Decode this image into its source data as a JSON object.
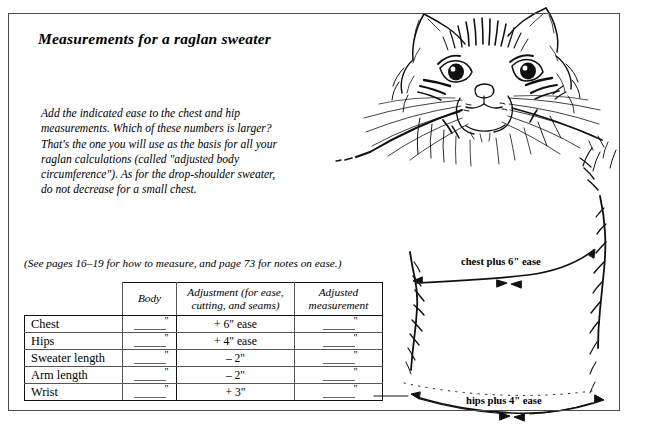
{
  "page": {
    "title": "Measurements for a raglan sweater",
    "intro": "Add the indicated ease to the chest and hip measurements. Which of these numbers is larger? That's the one you will use as the basis for all your raglan calculations (called \"adjusted body circumference\"). As for the drop-shoulder sweater, do not decrease for a small chest.",
    "caption": "(See pages 16–19 for how to measure, and page 73 for notes on ease.)"
  },
  "table": {
    "headers": [
      "",
      "Body",
      "Adjustment (for ease, cutting, and seams)",
      "Adjusted measurement"
    ],
    "rows": [
      {
        "label": "Chest",
        "body": "\"",
        "adjustment": "+ 6\" ease",
        "adjusted": "\""
      },
      {
        "label": "Hips",
        "body": "\"",
        "adjustment": "+ 4\" ease",
        "adjusted": "\""
      },
      {
        "label": "Sweater length",
        "body": "\"",
        "adjustment": "– 2\"",
        "adjusted": "\""
      },
      {
        "label": "Arm length",
        "body": "\"",
        "adjustment": "– 2\"",
        "adjusted": "\""
      },
      {
        "label": "Wrist",
        "body": "\"",
        "adjustment": "+ 3\"",
        "adjusted": "\""
      }
    ]
  },
  "annotations": {
    "chest": "chest plus 6\" ease",
    "hips": "hips plus 4\" ease"
  },
  "illustration": {
    "subject": "cat-wearing-sweater-line-drawing",
    "ink_color": "#101010",
    "frame_color": "#4a4a4a"
  }
}
